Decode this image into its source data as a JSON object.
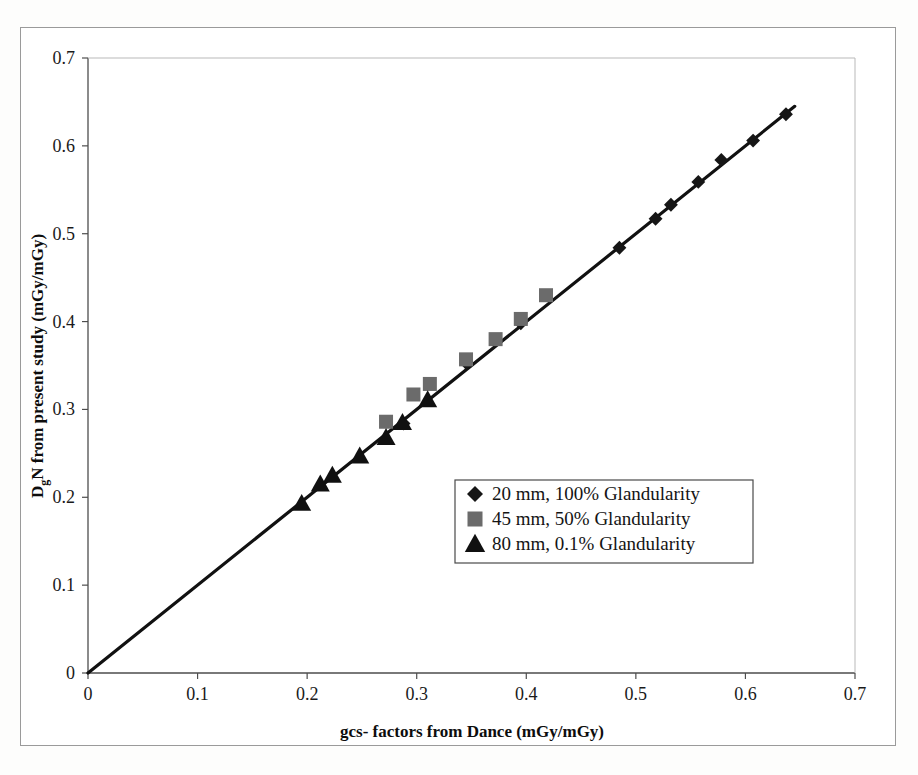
{
  "figure": {
    "background_color": "#ffffff",
    "frame_color": "#9a9a9a"
  },
  "chart_data": {
    "type": "scatter",
    "title": "",
    "xlabel": "gcs- factors from Dance (mGy/mGy)",
    "ylabel": "DgN from present study (mGy/mGy)",
    "ylabel_main_1": "D",
    "ylabel_sub": "g",
    "ylabel_main_2": "N from present study (mGy/mGy)",
    "xlim": [
      0,
      0.7
    ],
    "ylim": [
      0,
      0.7
    ],
    "xticks": [
      "0",
      "0.1",
      "0.2",
      "0.3",
      "0.4",
      "0.5",
      "0.6",
      "0.7"
    ],
    "yticks": [
      "0",
      "0.1",
      "0.2",
      "0.3",
      "0.4",
      "0.5",
      "0.6",
      "0.7"
    ],
    "xtick_values": [
      0,
      0.1,
      0.2,
      0.3,
      0.4,
      0.5,
      0.6,
      0.7
    ],
    "ytick_values": [
      0,
      0.1,
      0.2,
      0.3,
      0.4,
      0.5,
      0.6,
      0.7
    ],
    "grid": false,
    "legend_position": "center-right-inside",
    "trendline": {
      "name": "identity-line",
      "x": [
        0.0,
        0.645
      ],
      "y": [
        0.0,
        0.645
      ],
      "color": "#111111",
      "width": 3.2
    },
    "series": [
      {
        "name": "20 mm, 100% Glandularity",
        "label": "20 mm, 100% Glandularity",
        "marker": "diamond",
        "color": "#161616",
        "size": 13,
        "points": [
          [
            0.288,
            0.284
          ],
          [
            0.345,
            0.353
          ],
          [
            0.395,
            0.398
          ],
          [
            0.485,
            0.484
          ],
          [
            0.518,
            0.517
          ],
          [
            0.532,
            0.533
          ],
          [
            0.557,
            0.559
          ],
          [
            0.578,
            0.584
          ],
          [
            0.607,
            0.606
          ],
          [
            0.637,
            0.636
          ]
        ]
      },
      {
        "name": "45 mm, 50% Glandularity",
        "label": "45 mm, 50% Glandularity",
        "marker": "square",
        "color": "#6b6b6b",
        "size": 14,
        "points": [
          [
            0.272,
            0.286
          ],
          [
            0.297,
            0.317
          ],
          [
            0.312,
            0.329
          ],
          [
            0.345,
            0.357
          ],
          [
            0.372,
            0.38
          ],
          [
            0.395,
            0.403
          ],
          [
            0.418,
            0.43
          ]
        ]
      },
      {
        "name": "80 mm, 0.1% Glandularity",
        "label": "80 mm, 0.1% Glandularity",
        "marker": "triangle",
        "color": "#101010",
        "size": 14,
        "points": [
          [
            0.195,
            0.193
          ],
          [
            0.212,
            0.215
          ],
          [
            0.223,
            0.225
          ],
          [
            0.248,
            0.247
          ],
          [
            0.272,
            0.268
          ],
          [
            0.287,
            0.285
          ],
          [
            0.31,
            0.311
          ]
        ]
      }
    ]
  },
  "legend": {
    "items": [
      {
        "marker": "diamond",
        "color": "#161616",
        "label": "20 mm, 100% Glandularity"
      },
      {
        "marker": "square",
        "color": "#6b6b6b",
        "label": "45 mm, 50% Glandularity"
      },
      {
        "marker": "triangle",
        "color": "#101010",
        "label": "80 mm, 0.1% Glandularity"
      }
    ],
    "border_color": "#4a4a4a"
  }
}
